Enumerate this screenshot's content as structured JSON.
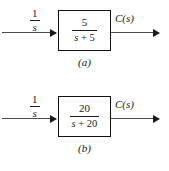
{
  "figure": {
    "type": "block-diagram",
    "count": 2,
    "diagrams": [
      {
        "id": "a",
        "caption": "(a)",
        "input": {
          "label_numerator": "1",
          "label_denominator": "s",
          "label": "1/s",
          "icon": "arrow-right-icon"
        },
        "block": {
          "numerator": "5",
          "denominator": "s + 5",
          "transfer_function": "5/(s + 5)"
        },
        "output": {
          "label": "C(s)",
          "icon": "arrow-right-icon"
        }
      },
      {
        "id": "b",
        "caption": "(b)",
        "input": {
          "label_numerator": "1",
          "label_denominator": "s",
          "label": "1/s",
          "icon": "arrow-right-icon"
        },
        "block": {
          "numerator": "20",
          "denominator": "s + 20",
          "transfer_function": "20/(s + 20)"
        },
        "output": {
          "label": "C(s)",
          "icon": "arrow-right-icon"
        }
      }
    ]
  },
  "colors": {
    "background": "#ffffff",
    "line": "#4a4a4a",
    "box_border": "#111111",
    "text": "#1a1a1a"
  }
}
